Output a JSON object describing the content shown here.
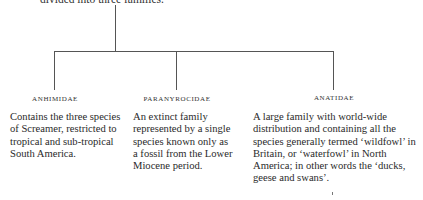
{
  "intro_text": "divided into three families.",
  "families": [
    {
      "name": "ANHIMIDAE",
      "description": "Contains the three species of Screamer, restricted to tropical and sub-tropical South America."
    },
    {
      "name": "PARANYROCIDAE",
      "description": "An extinct family represented by a single species known only as a fossil from the Lower Miocene period."
    },
    {
      "name": "ANATIDAE",
      "description": "A large family with world-wide distribution and containing all the species generally termed ‘wildfowl’ in Britain, or ‘waterfowl’ in North America; in other words the ‘ducks, geese and swans’."
    }
  ],
  "colors": {
    "line": "#555555",
    "text": "#2a2a2a"
  }
}
